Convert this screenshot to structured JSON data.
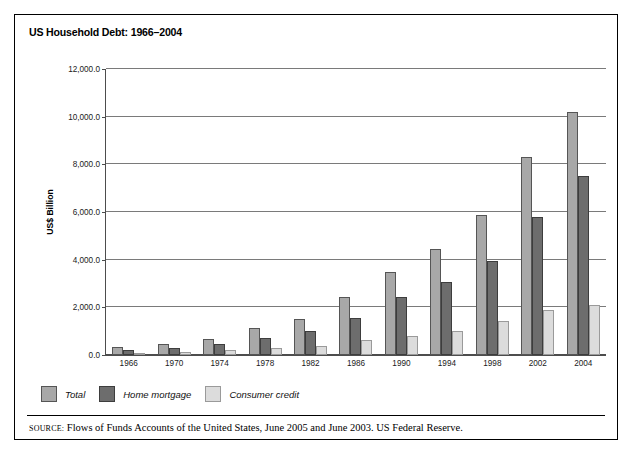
{
  "figure": {
    "title": "US Household Debt: 1966–2004",
    "source_keyword": "SOURCE:",
    "source_text": "Flows of Funds Accounts of the United States, June 2005 and June 2003. US Federal Reserve."
  },
  "legend": {
    "items": [
      {
        "label": "Total",
        "color": "#a8a8a8",
        "icon": "legend-swatch-total"
      },
      {
        "label": "Home mortgage",
        "color": "#6d6d6d",
        "icon": "legend-swatch-home-mortgage"
      },
      {
        "label": "Consumer credit",
        "color": "#dcdcdc",
        "icon": "legend-swatch-consumer-credit"
      }
    ]
  },
  "chart_data": {
    "type": "bar",
    "title": "US Household Debt: 1966–2004",
    "xlabel": "",
    "ylabel": "US$ Billion",
    "ylim": [
      0,
      12000
    ],
    "yticks": [
      0,
      2000,
      4000,
      6000,
      8000,
      10000,
      12000
    ],
    "ytick_labels": [
      "0.0",
      "2,000.0",
      "4,000.0",
      "6,000.0",
      "8,000.0",
      "10,000.0",
      "12,000.0"
    ],
    "grid": true,
    "legend_position": "below-left",
    "categories": [
      "1966",
      "1970",
      "1974",
      "1978",
      "1982",
      "1986",
      "1990",
      "1994",
      "1998",
      "2002",
      "2004"
    ],
    "series": [
      {
        "name": "Total",
        "color": "#a8a8a8",
        "values": [
          350,
          470,
          670,
          1130,
          1520,
          2450,
          3500,
          4450,
          5870,
          8300,
          10200
        ]
      },
      {
        "name": "Home mortgage",
        "color": "#6d6d6d",
        "values": [
          230,
          300,
          450,
          710,
          1010,
          1560,
          2440,
          3060,
          3930,
          5800,
          7500
        ]
      },
      {
        "name": "Consumer credit",
        "color": "#dcdcdc",
        "values": [
          90,
          130,
          200,
          310,
          360,
          620,
          800,
          990,
          1420,
          1900,
          2100
        ]
      }
    ]
  }
}
